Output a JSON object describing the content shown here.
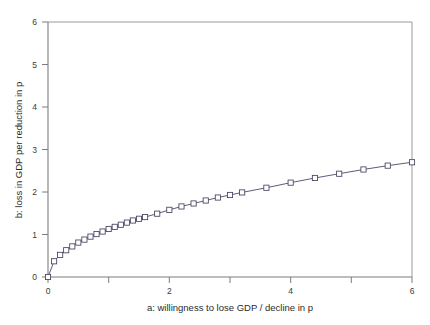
{
  "chart_data": {
    "type": "line",
    "title": "",
    "subtitle": "",
    "xlabel": "a: willingness to lose GDP / decline in p",
    "ylabel": "b: loss in GDP per reduction in p",
    "xlim": [
      0,
      6
    ],
    "ylim": [
      0,
      6
    ],
    "xticks": [
      0,
      1,
      2,
      3,
      4,
      5,
      6
    ],
    "yticks": [
      0,
      1,
      2,
      3,
      4,
      5,
      6
    ],
    "xtick_labels": [
      "0",
      "",
      "2",
      "",
      "4",
      "",
      "6"
    ],
    "ytick_labels": [
      "0",
      "1",
      "2",
      "3",
      "4",
      "5",
      "6"
    ],
    "grid": false,
    "legend": false,
    "legend_position": "none",
    "marker": "open-square",
    "line_color": "#42425f",
    "marker_face_color": "#ffffff",
    "marker_edge_color": "#42425f",
    "series": [
      {
        "name": "b vs a",
        "x": [
          0.0,
          0.1,
          0.2,
          0.3,
          0.4,
          0.5,
          0.6,
          0.7,
          0.8,
          0.9,
          1.0,
          1.1,
          1.2,
          1.3,
          1.4,
          1.5,
          1.6,
          1.8,
          2.0,
          2.2,
          2.4,
          2.6,
          2.8,
          3.0,
          3.2,
          3.6,
          4.0,
          4.4,
          4.8,
          5.2,
          5.6,
          6.0
        ],
        "y": [
          0.0,
          0.37,
          0.52,
          0.63,
          0.72,
          0.81,
          0.88,
          0.95,
          1.01,
          1.07,
          1.13,
          1.18,
          1.23,
          1.28,
          1.33,
          1.37,
          1.41,
          1.49,
          1.58,
          1.66,
          1.73,
          1.8,
          1.87,
          1.93,
          1.99,
          2.1,
          2.22,
          2.33,
          2.43,
          2.53,
          2.62,
          2.7
        ]
      }
    ]
  },
  "axes": {
    "x_title": "a: willingness to lose GDP / decline in p",
    "y_title": "b: loss in GDP per reduction in p",
    "x_labels": [
      "0",
      "2",
      "4",
      "6"
    ],
    "y_labels": [
      "0",
      "1",
      "2",
      "3",
      "4",
      "5",
      "6"
    ]
  }
}
